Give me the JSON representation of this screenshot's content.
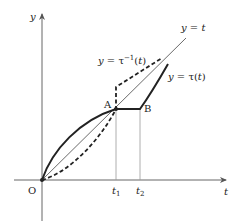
{
  "diagram": {
    "type": "function-graph",
    "axes": {
      "x_label": "t",
      "y_label": "y",
      "origin_label": "O"
    },
    "points": {
      "A": "A",
      "B": "B"
    },
    "ticks": {
      "t1": "t",
      "t1_sub": "1",
      "t2": "t",
      "t2_sub": "2"
    },
    "curves": {
      "identity": {
        "label": "y = t",
        "style": "thin solid"
      },
      "tau": {
        "label": "y = τ(t)",
        "style": "thick solid"
      },
      "tau_inverse": {
        "label": "y = τ⁻¹(t)",
        "style": "thick dashed"
      }
    },
    "labels": {
      "identity_y": "y",
      "identity_eq": " = ",
      "identity_t": "t",
      "tau_y": "y",
      "tau_eq": " = τ(",
      "tau_t": "t",
      "tau_close": ")",
      "tauinv_y": "y",
      "tauinv_eq": " = τ",
      "tauinv_sup": "−1",
      "tauinv_open": "(",
      "tauinv_t": "t",
      "tauinv_close": ")"
    },
    "colors": {
      "axis": "#666666",
      "curve": "#222222",
      "guide": "#999999"
    }
  }
}
